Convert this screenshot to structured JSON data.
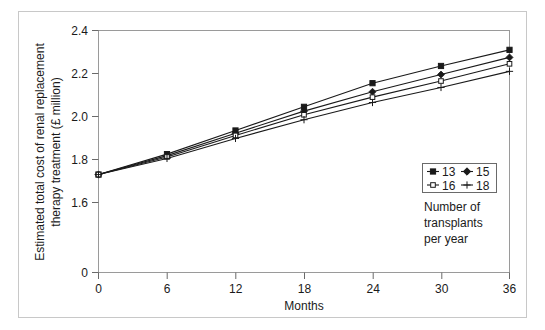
{
  "chart_data": {
    "type": "line",
    "title": "",
    "xlabel": "Months",
    "ylabel": "Estimated total cost of renal replacement therapy treatment (£ million)",
    "ylabel_line1": "Estimated total cost of renal replacement",
    "ylabel_line2": "therapy treatment (£ million)",
    "x": [
      0,
      6,
      12,
      18,
      24,
      30,
      36
    ],
    "xticks": [
      "0",
      "6",
      "12",
      "18",
      "24",
      "30",
      "36"
    ],
    "yticks": [
      "0",
      "1.6",
      "1.8",
      "2.0",
      "2.2",
      "2.4"
    ],
    "ytick_values": [
      0,
      1.6,
      1.8,
      2.0,
      2.2,
      2.4
    ],
    "xlim": [
      0,
      36
    ],
    "ylim_display": [
      1.5,
      2.4
    ],
    "y_axis_break": true,
    "grid": false,
    "legend_position": "right-middle",
    "legend_title_line1": "Number of",
    "legend_title_line2": "transplants",
    "legend_title_line3": "per year",
    "series": [
      {
        "name": "13",
        "marker": "filled-square",
        "values": [
          1.73,
          1.825,
          1.935,
          2.045,
          2.155,
          2.235,
          2.31
        ]
      },
      {
        "name": "15",
        "marker": "filled-diamond",
        "values": [
          1.73,
          1.818,
          1.922,
          2.025,
          2.115,
          2.195,
          2.275
        ]
      },
      {
        "name": "16",
        "marker": "open-square",
        "values": [
          1.73,
          1.812,
          1.912,
          2.008,
          2.09,
          2.165,
          2.245
        ]
      },
      {
        "name": "18",
        "marker": "plus",
        "values": [
          1.73,
          1.805,
          1.898,
          1.985,
          2.065,
          2.135,
          2.21
        ]
      }
    ],
    "colors": {
      "line": "#1a1a1a",
      "axis": "#808080",
      "frame": "#c8c8c8",
      "marker_fill": "#1a1a1a",
      "marker_open_fill": "#ffffff",
      "background": "#ffffff"
    }
  }
}
